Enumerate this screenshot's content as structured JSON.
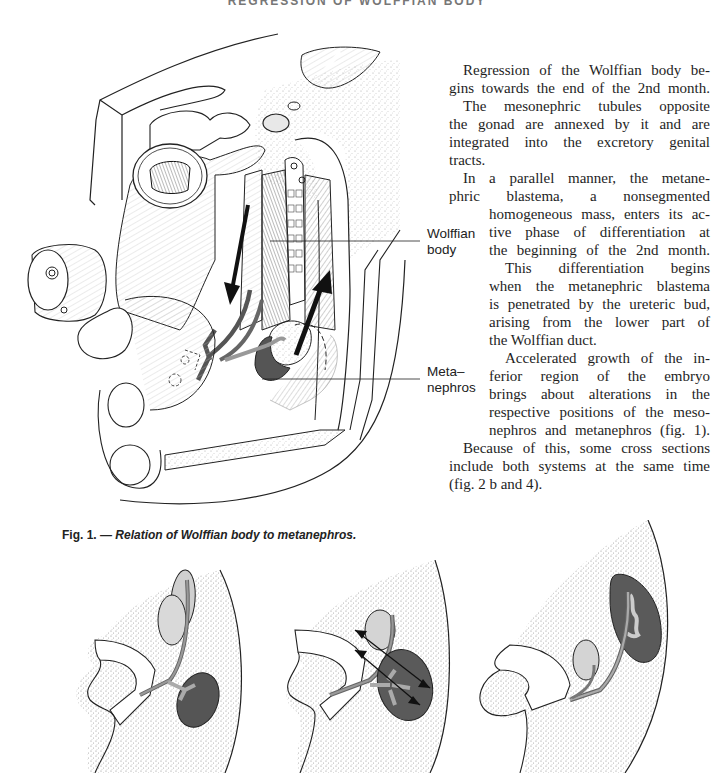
{
  "page": {
    "running_header": "REGRESSION OF WOLFFIAN BODY"
  },
  "body_text": {
    "lines": [
      "Regression of the Wolffian body be-",
      "gins towards the end of the 2nd month.",
      "The mesonephric tubules opposite",
      "the gonad are annexed by it and are",
      "integrated into the excretory genital",
      "tracts.",
      "In a parallel manner, the metane-",
      "phric blastema, a nonsegmented",
      "homogeneous mass, enters its ac-",
      "tive phase of differentiation at",
      "the beginning of the 2nd month.",
      "This differentiation begins",
      "when the metanephric blastema",
      "is penetrated by the ureteric bud,",
      "arising from the lower part of",
      "the Wolffian duct.",
      "Accelerated growth of the in-",
      "ferior region of the embryo",
      "brings about alterations in the",
      "respective positions of the meso-",
      "nephros and metanephros (fig. 1).",
      "Because of this, some cross sections",
      "include both systems at the same time",
      "(fig. 2 b and 4)."
    ]
  },
  "figure_1": {
    "labels": {
      "wolffian_body_line1": "Wolffian",
      "wolffian_body_line2": "body",
      "metanephros_line1": "Meta–",
      "metanephros_line2": "nephros"
    },
    "caption_number": "Fig. 1. — ",
    "caption_text": "Relation of Wolffian body to metanephros."
  },
  "colors": {
    "ink": "#1a1a1a",
    "dark_kidney": "#555555",
    "light_gonad": "#cfcfcf",
    "duct": "#888888",
    "stipple": "#9a9a9a"
  }
}
